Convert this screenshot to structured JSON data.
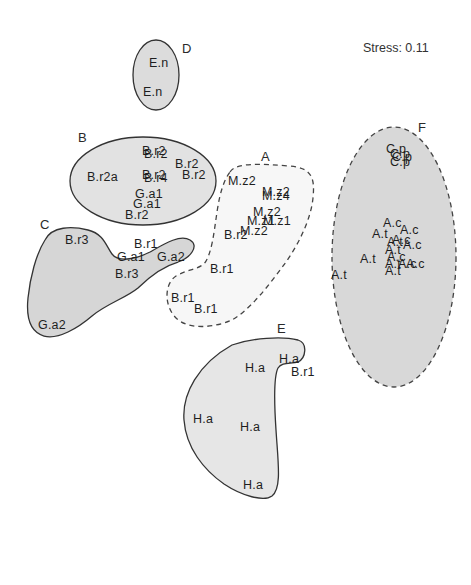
{
  "stress": "Stress: 0.11",
  "groups": {
    "A": {
      "label": "A",
      "style": "dashed",
      "fill": "#f7f7f7"
    },
    "B": {
      "label": "B",
      "style": "solid",
      "fill": "#e2e2e2"
    },
    "C": {
      "label": "C",
      "style": "solid",
      "fill": "#d6d6d6"
    },
    "D": {
      "label": "D",
      "style": "solid",
      "fill": "#dcdcdc"
    },
    "E": {
      "label": "E",
      "style": "solid",
      "fill": "#e6e6e6"
    },
    "F": {
      "label": "F",
      "style": "dashed",
      "fill": "#d8d8d8"
    }
  },
  "points": [
    {
      "group": "D",
      "text": "E.n",
      "x": 149,
      "y": 57
    },
    {
      "group": "D",
      "text": "E.n",
      "x": 143,
      "y": 86
    },
    {
      "group": "B",
      "text": "B.r2",
      "x": 142,
      "y": 145
    },
    {
      "group": "B",
      "text": "B.r2",
      "x": 144,
      "y": 148
    },
    {
      "group": "B",
      "text": "B.r2",
      "x": 175,
      "y": 158
    },
    {
      "group": "B",
      "text": "B.r2",
      "x": 182,
      "y": 169
    },
    {
      "group": "B",
      "text": "B.r2a",
      "x": 87,
      "y": 171
    },
    {
      "group": "B",
      "text": "B.r2",
      "x": 142,
      "y": 169
    },
    {
      "group": "B",
      "text": "B.r4",
      "x": 144,
      "y": 172
    },
    {
      "group": "B",
      "text": "G.a1",
      "x": 135,
      "y": 188
    },
    {
      "group": "B",
      "text": "G.a1",
      "x": 133,
      "y": 198
    },
    {
      "group": "B",
      "text": "B.r2",
      "x": 125,
      "y": 209
    },
    {
      "group": "C",
      "text": "B.r3",
      "x": 65,
      "y": 234
    },
    {
      "group": "C",
      "text": "B.r1",
      "x": 134,
      "y": 238
    },
    {
      "group": "C",
      "text": "G.a1",
      "x": 117,
      "y": 251
    },
    {
      "group": "C",
      "text": "G.a2",
      "x": 157,
      "y": 251
    },
    {
      "group": "C",
      "text": "B.r3",
      "x": 115,
      "y": 268
    },
    {
      "group": "C",
      "text": "G.a2",
      "x": 38,
      "y": 319
    },
    {
      "group": "A",
      "text": "M.z2",
      "x": 228,
      "y": 175
    },
    {
      "group": "A",
      "text": "M.z2",
      "x": 262,
      "y": 186
    },
    {
      "group": "A",
      "text": "M.z4",
      "x": 262,
      "y": 190
    },
    {
      "group": "A",
      "text": "M.z2",
      "x": 253,
      "y": 206
    },
    {
      "group": "A",
      "text": "M.z1",
      "x": 247,
      "y": 215
    },
    {
      "group": "A",
      "text": "M.z1",
      "x": 263,
      "y": 215
    },
    {
      "group": "A",
      "text": "M.z2",
      "x": 240,
      "y": 225
    },
    {
      "group": "A",
      "text": "B.r2",
      "x": 224,
      "y": 229
    },
    {
      "group": "A",
      "text": "B.r1",
      "x": 210,
      "y": 263
    },
    {
      "group": "A",
      "text": "B.r1",
      "x": 171,
      "y": 292
    },
    {
      "group": "A",
      "text": "B.r1",
      "x": 194,
      "y": 303
    },
    {
      "group": "F",
      "text": "C.p",
      "x": 386,
      "y": 143
    },
    {
      "group": "F",
      "text": "C.p",
      "x": 390,
      "y": 148
    },
    {
      "group": "F",
      "text": "C.p",
      "x": 392,
      "y": 151
    },
    {
      "group": "F",
      "text": "C.p",
      "x": 390,
      "y": 156
    },
    {
      "group": "F",
      "text": "A.c",
      "x": 383,
      "y": 217
    },
    {
      "group": "F",
      "text": "A.c",
      "x": 400,
      "y": 224
    },
    {
      "group": "F",
      "text": "A.t",
      "x": 372,
      "y": 228
    },
    {
      "group": "F",
      "text": "A.c",
      "x": 392,
      "y": 234
    },
    {
      "group": "F",
      "text": "A.t",
      "x": 387,
      "y": 236
    },
    {
      "group": "F",
      "text": "A.c",
      "x": 403,
      "y": 239
    },
    {
      "group": "F",
      "text": "A.t",
      "x": 385,
      "y": 244
    },
    {
      "group": "F",
      "text": "A.t",
      "x": 360,
      "y": 253
    },
    {
      "group": "F",
      "text": "A.c",
      "x": 387,
      "y": 251
    },
    {
      "group": "F",
      "text": "A.t",
      "x": 385,
      "y": 258
    },
    {
      "group": "F",
      "text": "A.c",
      "x": 398,
      "y": 258
    },
    {
      "group": "F",
      "text": "A.c",
      "x": 406,
      "y": 258
    },
    {
      "group": "F",
      "text": "A.t",
      "x": 385,
      "y": 265
    },
    {
      "group": "F",
      "text": "A.t",
      "x": 331,
      "y": 269
    },
    {
      "group": "E",
      "text": "H.a",
      "x": 279,
      "y": 353
    },
    {
      "group": "E",
      "text": "H.a",
      "x": 245,
      "y": 362
    },
    {
      "group": "E",
      "text": "B.r1",
      "x": 291,
      "y": 366
    },
    {
      "group": "E",
      "text": "H.a",
      "x": 193,
      "y": 413
    },
    {
      "group": "E",
      "text": "H.a",
      "x": 240,
      "y": 421
    },
    {
      "group": "E",
      "text": "H.a",
      "x": 243,
      "y": 479
    }
  ]
}
